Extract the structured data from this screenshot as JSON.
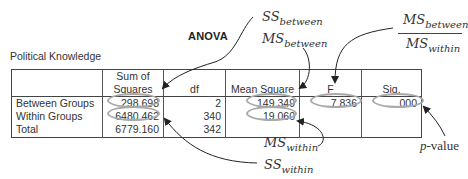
{
  "title": "ANOVA",
  "subtitle": "Political Knowledge",
  "table": {
    "headers": [
      "",
      "Sum of Squares",
      "df",
      "Mean Square",
      "F",
      "Sig."
    ],
    "header_lines": {
      "ss_line1": "Sum of",
      "ss_line2": "Squares"
    },
    "rows": [
      {
        "label": "Between Groups",
        "ss": "298.698",
        "df": "2",
        "ms": "149.349",
        "f": "7.836",
        "sig": ".000"
      },
      {
        "label": "Within Groups",
        "ss": "6480.462",
        "df": "340",
        "ms": "19.060",
        "f": "",
        "sig": ""
      },
      {
        "label": "Total",
        "ss": "6779.160",
        "df": "342",
        "ms": "",
        "f": "",
        "sig": ""
      }
    ]
  },
  "annotations": {
    "ss_between": {
      "base": "SS",
      "sub": "between"
    },
    "ms_between": {
      "base": "MS",
      "sub": "between"
    },
    "f_ratio": {
      "num_base": "MS",
      "num_sub": "between",
      "den_base": "MS",
      "den_sub": "within"
    },
    "ms_within": {
      "base": "MS",
      "sub": "within"
    },
    "ss_within": {
      "base": "SS",
      "sub": "within"
    },
    "p_value": {
      "p": "p",
      "rest": "-value"
    }
  },
  "colors": {
    "highlight_ring": "#a9a9a9",
    "arrow": "#222222",
    "table_border": "#444444"
  }
}
